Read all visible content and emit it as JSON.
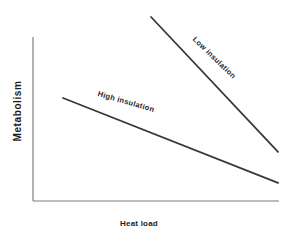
{
  "figure": {
    "background": "#ffffff",
    "axis_color": "#7d7d7d",
    "line_color": "#383838",
    "text_color": "#1c1c1c"
  },
  "chart_data": {
    "type": "line",
    "title": "",
    "xlabel": "Heat load",
    "ylabel": "Metabolism",
    "axis_style": "conceptual schematic; plain L-shaped axes, no ticks, no numeric scale, no gridlines",
    "xlim": [
      0,
      100
    ],
    "ylim": [
      0,
      100
    ],
    "x_ticks": [],
    "y_ticks": [],
    "legend": "labels written along the lines",
    "series": [
      {
        "name": "low-insulation",
        "label": "Low insulation",
        "x": [
          48.0,
          99.6
        ],
        "y": [
          112.2,
          29.9
        ],
        "trend": "steep negative slope; metabolism falls rapidly as heat load rises"
      },
      {
        "name": "high-insulation",
        "label": "High insulation",
        "x": [
          12.2,
          99.6
        ],
        "y": [
          62.8,
          11.0
        ],
        "trend": "shallow negative slope; metabolism falls slowly as heat load rises"
      }
    ]
  }
}
